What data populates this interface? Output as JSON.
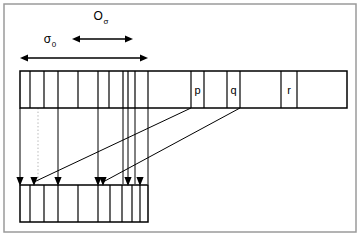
{
  "figure": {
    "background_color": "#ffffff",
    "line_color": "#000000",
    "border": {
      "color": "#9a9a9a",
      "x": 4,
      "y": 4,
      "width": 352,
      "height": 228
    }
  },
  "dimensions": [
    {
      "name": "offset-sigma",
      "label_main": "O",
      "label_sub": "σ",
      "label_x": 101,
      "label_y": 20,
      "arrow_y": 39,
      "x_start": 72,
      "x_end": 133
    },
    {
      "name": "sigma-zero",
      "label_main": "σ",
      "label_sub": "0",
      "label_x": 50,
      "label_y": 43,
      "arrow_y": 58,
      "x_start": 20,
      "x_end": 148
    }
  ],
  "top_row": {
    "name": "upper-array",
    "x": 20,
    "y": 71,
    "width": 327,
    "height": 37,
    "dividers": [
      30,
      44,
      58,
      78,
      98,
      109,
      123,
      128,
      135,
      148,
      191,
      204,
      227,
      240,
      281,
      297
    ],
    "cells": [
      {
        "label": "",
        "x_left": 20,
        "x_right": 30
      },
      {
        "label": "",
        "x_left": 30,
        "x_right": 44
      },
      {
        "label": "",
        "x_left": 44,
        "x_right": 58
      },
      {
        "label": "",
        "x_left": 58,
        "x_right": 78
      },
      {
        "label": "",
        "x_left": 78,
        "x_right": 98
      },
      {
        "label": "",
        "x_left": 98,
        "x_right": 109
      },
      {
        "label": "",
        "x_left": 109,
        "x_right": 123
      },
      {
        "label": "",
        "x_left": 123,
        "x_right": 128
      },
      {
        "label": "",
        "x_left": 128,
        "x_right": 135
      },
      {
        "label": "",
        "x_left": 135,
        "x_right": 148
      },
      {
        "label": "",
        "x_left": 148,
        "x_right": 191
      },
      {
        "label": "p",
        "x_left": 191,
        "x_right": 204
      },
      {
        "label": "",
        "x_left": 204,
        "x_right": 227
      },
      {
        "label": "q",
        "x_left": 227,
        "x_right": 240
      },
      {
        "label": "",
        "x_left": 240,
        "x_right": 281
      },
      {
        "label": "r",
        "x_left": 281,
        "x_right": 297
      },
      {
        "label": "",
        "x_left": 297,
        "x_right": 347
      }
    ]
  },
  "bottom_row": {
    "name": "lower-array",
    "x": 20,
    "y": 185,
    "width": 128,
    "height": 37,
    "dividers": [
      30,
      44,
      58,
      78,
      98,
      110,
      122,
      132,
      140
    ]
  },
  "connectors": {
    "vertical_solid": [
      {
        "name": "drop-line-0",
        "x": 20
      },
      {
        "name": "drop-line-1",
        "x": 58
      },
      {
        "name": "drop-line-2",
        "x": 98
      },
      {
        "name": "drop-line-3",
        "x": 123
      },
      {
        "name": "drop-line-4",
        "x": 128
      },
      {
        "name": "drop-line-5",
        "x": 135
      },
      {
        "name": "drop-line-6",
        "x": 148
      }
    ],
    "vertical_dotted": [
      {
        "name": "dotted-drop-line",
        "x": 38
      }
    ],
    "diagonal": [
      {
        "name": "diagonal-from-p",
        "x_start": 191,
        "y_start": 108,
        "x_end": 34,
        "y_end": 182
      },
      {
        "name": "diagonal-from-q",
        "x_start": 240,
        "y_start": 108,
        "x_end": 103,
        "y_end": 182
      }
    ],
    "arrow_tip_y": 184,
    "arrowheads": [
      {
        "name": "arrowhead-0",
        "x": 20
      },
      {
        "name": "arrowhead-1",
        "x": 34
      },
      {
        "name": "arrowhead-2",
        "x": 58
      },
      {
        "name": "arrowhead-3",
        "x": 98
      },
      {
        "name": "arrowhead-4",
        "x": 103
      },
      {
        "name": "arrowhead-5",
        "x": 128
      },
      {
        "name": "arrowhead-6",
        "x": 140
      }
    ]
  }
}
